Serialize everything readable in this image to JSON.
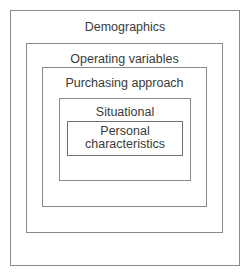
{
  "diagram": {
    "type": "nested-boxes",
    "layers": [
      {
        "id": "demographics",
        "label": "Demographics",
        "level": 1
      },
      {
        "id": "operating",
        "label": "Operating variables",
        "level": 2
      },
      {
        "id": "purchasing",
        "label": "Purchasing approach",
        "level": 3
      },
      {
        "id": "situational",
        "label": "Situational",
        "level": 4
      },
      {
        "id": "personal",
        "label_line1": "Personal",
        "label_line2": "characteristics",
        "level": 5
      }
    ],
    "colors": {
      "border": "#8a8a8a",
      "text": "#3a3a3a",
      "background": "#ffffff"
    }
  }
}
